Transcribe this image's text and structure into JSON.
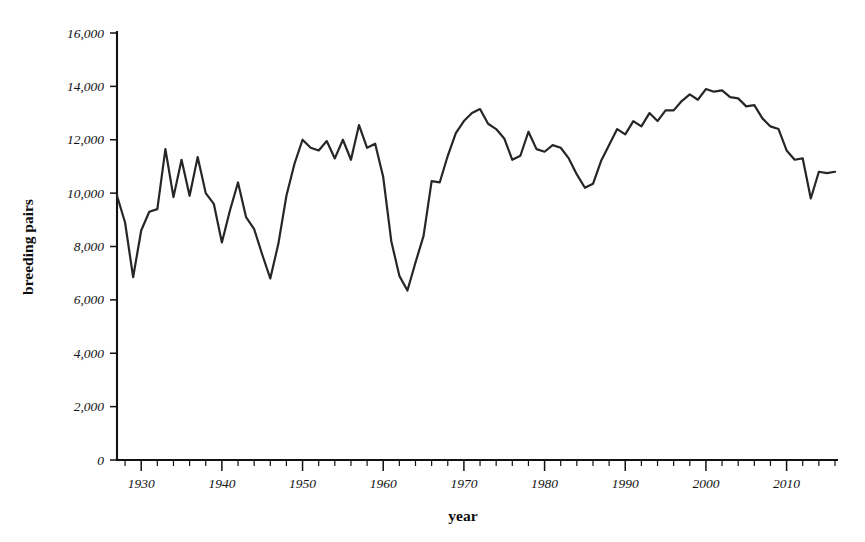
{
  "figure": {
    "background_color": "#ffffff",
    "line_color": "#262626",
    "text_color": "#111111"
  },
  "axis_titles": {
    "x": "year",
    "y": "breeding pairs"
  },
  "chart_data": {
    "type": "line",
    "title": "",
    "xlabel": "year",
    "ylabel": "breeding pairs",
    "xlim": [
      1927,
      2016
    ],
    "ylim": [
      0,
      16000
    ],
    "grid": false,
    "legend": "none",
    "x_tick_labels": [
      "1930",
      "1940",
      "1950",
      "1960",
      "1970",
      "1980",
      "1990",
      "2000",
      "2010"
    ],
    "x_ticks": [
      1930,
      1940,
      1950,
      1960,
      1970,
      1980,
      1990,
      2000,
      2010
    ],
    "x_minor_tick_step": 2,
    "y_tick_labels": [
      "0",
      "2,000",
      "4,000",
      "6,000",
      "8,000",
      "10,000",
      "12,000",
      "14,000",
      "16,000"
    ],
    "y_ticks": [
      0,
      2000,
      4000,
      6000,
      8000,
      10000,
      12000,
      14000,
      16000
    ],
    "series": [
      {
        "name": "breeding pairs",
        "color": "#262626",
        "x": [
          1927,
          1928,
          1929,
          1930,
          1931,
          1932,
          1933,
          1934,
          1935,
          1936,
          1937,
          1938,
          1939,
          1940,
          1941,
          1942,
          1943,
          1944,
          1945,
          1946,
          1947,
          1948,
          1949,
          1950,
          1951,
          1952,
          1953,
          1954,
          1955,
          1956,
          1957,
          1958,
          1959,
          1960,
          1961,
          1962,
          1963,
          1964,
          1965,
          1966,
          1967,
          1968,
          1969,
          1970,
          1971,
          1972,
          1973,
          1974,
          1975,
          1976,
          1977,
          1978,
          1979,
          1980,
          1981,
          1982,
          1983,
          1984,
          1985,
          1986,
          1987,
          1988,
          1989,
          1990,
          1991,
          1992,
          1993,
          1994,
          1995,
          1996,
          1997,
          1998,
          1999,
          2000,
          2001,
          2002,
          2003,
          2004,
          2005,
          2006,
          2007,
          2008,
          2009,
          2010,
          2011,
          2012,
          2013,
          2014,
          2015,
          2016
        ],
        "values": [
          9900,
          8900,
          6850,
          8600,
          9300,
          9400,
          11650,
          9850,
          11250,
          9900,
          11350,
          10000,
          9600,
          8150,
          9350,
          10400,
          9100,
          8650,
          7700,
          6800,
          8100,
          9900,
          11100,
          12000,
          11700,
          11600,
          11950,
          11300,
          12000,
          11250,
          12550,
          11700,
          11850,
          10600,
          8200,
          6900,
          6350,
          7400,
          8400,
          10450,
          10400,
          11400,
          12250,
          12700,
          13000,
          13150,
          12600,
          12400,
          12050,
          11250,
          11400,
          12300,
          11650,
          11550,
          11800,
          11700,
          11300,
          10700,
          10200,
          10350,
          11200,
          11800,
          12400,
          12200,
          12700,
          12500,
          13000,
          12700,
          13100,
          13100,
          13450,
          13700,
          13500,
          13900,
          13800,
          13850,
          13600,
          13550,
          13250,
          13300,
          12800,
          12500,
          12400,
          11600,
          11250,
          11300,
          9800,
          10800,
          10750,
          10800
        ]
      }
    ]
  }
}
